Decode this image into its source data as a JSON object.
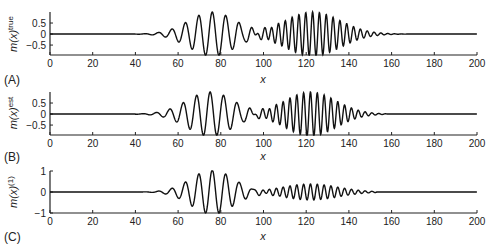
{
  "chart_data": [
    {
      "type": "line",
      "panel_label": "(A)",
      "ylabel": "m(x)^true",
      "ylabel_base": "m(x)",
      "ylabel_sup": "true",
      "xlabel": "x",
      "xlim": [
        0,
        200
      ],
      "ylim": [
        -0.95,
        1.0
      ],
      "xticks": [
        0,
        20,
        40,
        60,
        80,
        100,
        120,
        140,
        160,
        180,
        200
      ],
      "yticks": [
        0.5,
        0,
        -0.5
      ],
      "ytick_labels": [
        "0.5",
        "0",
        "−0.5"
      ],
      "grid": false,
      "series": [
        {
          "name": "true model",
          "description": "Sum of two Gaussian-windowed sinusoidal wave packets",
          "packets": [
            {
              "center": 76,
              "width": 11,
              "amplitude": 1.0,
              "period": 6.3
            },
            {
              "center": 123,
              "width": 13,
              "amplitude": 1.0,
              "period": 3.2
            }
          ],
          "flat_before": 30,
          "flat_after": 168
        }
      ]
    },
    {
      "type": "line",
      "panel_label": "(B)",
      "ylabel": "m^est(x)",
      "ylabel_base": "m(x)",
      "ylabel_sup": "est",
      "xlabel": "x",
      "xlim": [
        0,
        200
      ],
      "ylim": [
        -0.95,
        1.0
      ],
      "xticks": [
        0,
        20,
        40,
        60,
        80,
        100,
        120,
        140,
        160,
        180,
        200
      ],
      "yticks": [
        0.5,
        0,
        -0.5
      ],
      "ytick_labels": [
        "0.5",
        "0",
        "−0.5"
      ],
      "grid": false,
      "series": [
        {
          "name": "estimated model",
          "packets": [
            {
              "center": 75,
              "width": 11,
              "amplitude": 1.0,
              "period": 6.3
            },
            {
              "center": 122,
              "width": 12,
              "amplitude": 1.0,
              "period": 3.2
            }
          ],
          "flat_before": 40,
          "flat_after": 158
        }
      ]
    },
    {
      "type": "line",
      "panel_label": "(C)",
      "ylabel": "m^(1)(x)",
      "ylabel_base": "m(x)",
      "ylabel_sup": "(1)",
      "xlabel": "x",
      "xlim": [
        0,
        200
      ],
      "ylim": [
        -1,
        1
      ],
      "xticks": [
        0,
        20,
        40,
        60,
        80,
        100,
        120,
        140,
        160,
        180,
        200
      ],
      "yticks": [
        1,
        0,
        -1
      ],
      "ytick_labels": [
        "1",
        "0",
        "−1"
      ],
      "grid": false,
      "series": [
        {
          "name": "first iteration model",
          "packets": [
            {
              "center": 76,
              "width": 10,
              "amplitude": 1.05,
              "period": 6.3
            },
            {
              "center": 122,
              "width": 13,
              "amplitude": 0.38,
              "period": 3.2
            }
          ],
          "flat_before": 40,
          "flat_after": 153
        }
      ]
    }
  ],
  "style": {
    "line_color": "#111111",
    "axis_color": "#222222"
  }
}
